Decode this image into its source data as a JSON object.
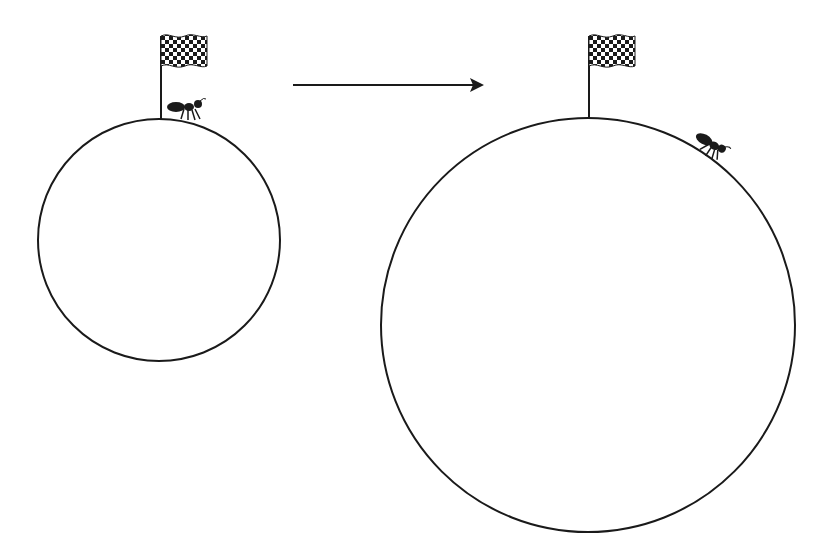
{
  "diagram": {
    "colors": {
      "background": "#ffffff",
      "stroke": "#1a1a1a"
    },
    "left_scene": {
      "circle": {
        "cx": 159,
        "cy": 240,
        "r": 121
      },
      "flag": {
        "pole_x": 160,
        "pole_top": 36,
        "pole_bottom": 119,
        "label": "checkered-flag"
      },
      "ant": {
        "x": 186,
        "y": 111,
        "label": "ant"
      }
    },
    "arrow": {
      "x1": 293,
      "y1": 85,
      "x2": 483,
      "y2": 85,
      "label": "transform-arrow"
    },
    "right_scene": {
      "circle": {
        "cx": 588,
        "cy": 325,
        "r": 205
      },
      "flag": {
        "pole_x": 589,
        "pole_top": 35,
        "pole_bottom": 117,
        "label": "checkered-flag"
      },
      "ant": {
        "x": 715,
        "y": 146,
        "label": "ant"
      }
    }
  }
}
